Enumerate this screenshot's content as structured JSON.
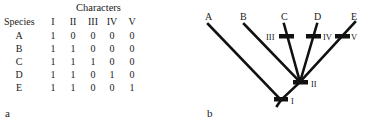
{
  "panel_a": {
    "label": "a",
    "characters_title": "Characters",
    "species_header": "Species",
    "character_headers": [
      "I",
      "II",
      "III",
      "IV",
      "V"
    ],
    "rows": [
      {
        "species": "A",
        "values": [
          "1",
          "0",
          "0",
          "0",
          "0"
        ]
      },
      {
        "species": "B",
        "values": [
          "1",
          "1",
          "0",
          "0",
          "0"
        ]
      },
      {
        "species": "C",
        "values": [
          "1",
          "1",
          "1",
          "0",
          "0"
        ]
      },
      {
        "species": "D",
        "values": [
          "1",
          "1",
          "0",
          "1",
          "0"
        ]
      },
      {
        "species": "E",
        "values": [
          "1",
          "1",
          "0",
          "0",
          "1"
        ]
      }
    ]
  },
  "panel_b": {
    "label": "b",
    "taxa": [
      "A",
      "B",
      "C",
      "D",
      "E"
    ],
    "characters": [
      "I",
      "II",
      "III",
      "IV",
      "V"
    ],
    "line_color": "#111111"
  }
}
